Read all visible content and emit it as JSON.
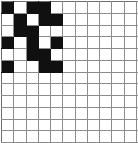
{
  "grid": {
    "title": "nonogram-grid",
    "columns": 12,
    "rows": 13,
    "fill_color": "#101010",
    "empty_color": "#ffffff",
    "line_color": "#8c8c8c",
    "cells": [
      [
        1,
        0,
        1,
        1,
        0,
        0,
        0,
        0,
        0,
        0,
        0,
        0
      ],
      [
        0,
        1,
        0,
        1,
        1,
        0,
        0,
        0,
        0,
        0,
        0,
        0
      ],
      [
        0,
        1,
        1,
        0,
        0,
        0,
        0,
        0,
        0,
        0,
        0,
        0
      ],
      [
        1,
        0,
        1,
        0,
        1,
        0,
        0,
        0,
        0,
        0,
        0,
        0
      ],
      [
        0,
        0,
        1,
        1,
        0,
        0,
        0,
        0,
        0,
        0,
        0,
        0
      ],
      [
        1,
        0,
        0,
        1,
        1,
        0,
        0,
        0,
        0,
        0,
        0,
        0
      ],
      [
        0,
        0,
        0,
        0,
        0,
        0,
        0,
        0,
        0,
        0,
        0,
        0
      ],
      [
        0,
        0,
        0,
        0,
        0,
        0,
        0,
        0,
        0,
        0,
        0,
        0
      ],
      [
        0,
        0,
        0,
        0,
        0,
        0,
        0,
        0,
        0,
        0,
        0,
        0
      ],
      [
        0,
        0,
        0,
        0,
        0,
        0,
        0,
        0,
        0,
        0,
        0,
        0
      ],
      [
        0,
        0,
        0,
        0,
        0,
        0,
        0,
        0,
        0,
        0,
        0,
        0
      ],
      [
        0,
        0,
        0,
        0,
        0,
        0,
        0,
        0,
        0,
        0,
        0,
        0
      ],
      [
        0,
        0,
        0,
        0,
        0,
        0,
        0,
        0,
        0,
        0,
        0,
        0
      ]
    ]
  }
}
